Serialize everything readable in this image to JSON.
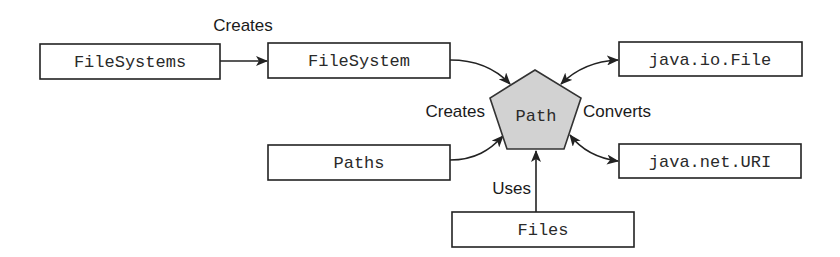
{
  "diagram": {
    "colors": {
      "stroke": "#222222",
      "box_fill": "#ffffff",
      "path_fill": "#d2d2d2",
      "text": "#2a2a2a"
    },
    "nodes": {
      "filesystems": {
        "label": "FileSystems"
      },
      "filesystem": {
        "label": "FileSystem"
      },
      "path": {
        "label": "Path",
        "shape": "pentagon"
      },
      "paths": {
        "label": "Paths"
      },
      "files": {
        "label": "Files"
      },
      "java_io_file": {
        "label": "java.io.File"
      },
      "java_net_uri": {
        "label": "java.net.URI"
      }
    },
    "edge_labels": {
      "creates_top": "Creates",
      "creates_left": "Creates",
      "converts": "Converts",
      "uses": "Uses"
    },
    "edges": [
      {
        "from": "FileSystems",
        "to": "FileSystem",
        "label": "Creates",
        "direction": "one-way"
      },
      {
        "from": "FileSystem",
        "to": "Path",
        "label": "Creates",
        "direction": "one-way"
      },
      {
        "from": "Paths",
        "to": "Path",
        "label": "Creates",
        "direction": "one-way"
      },
      {
        "from": "Files",
        "to": "Path",
        "label": "Uses",
        "direction": "one-way"
      },
      {
        "from": "Path",
        "to": "java.io.File",
        "label": "Converts",
        "direction": "two-way"
      },
      {
        "from": "Path",
        "to": "java.net.URI",
        "label": "Converts",
        "direction": "two-way"
      }
    ]
  }
}
